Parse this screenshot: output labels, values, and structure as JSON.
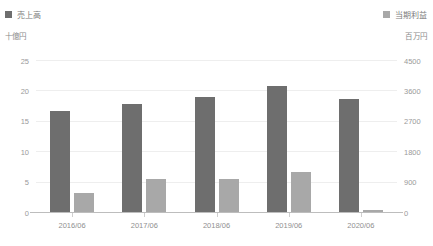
{
  "chart_data": {
    "type": "bar",
    "title": "",
    "categories": [
      "2016/06",
      "2017/06",
      "2018/06",
      "2019/06",
      "2020/06"
    ],
    "series": [
      {
        "name": "売上高",
        "axis": "left",
        "unit": "十億円",
        "color": "#6e6e6e",
        "values": [
          16.7,
          17.9,
          19.1,
          20.9,
          18.7
        ]
      },
      {
        "name": "当期利益",
        "axis": "right",
        "unit": "百万円",
        "color": "#a8a8a8",
        "values": [
          580,
          1000,
          1000,
          1200,
          100
        ]
      }
    ],
    "xlabel": "",
    "ylabel": "十億円",
    "y2label": "百万円",
    "ylim": [
      0,
      25
    ],
    "y2lim": [
      0,
      4500
    ],
    "yticks": [
      "0",
      "5",
      "10",
      "15",
      "20",
      "25"
    ],
    "ytick_values": [
      0,
      5,
      10,
      15,
      20,
      25
    ],
    "y2ticks": [
      "0",
      "900",
      "1800",
      "2700",
      "3600",
      "4500"
    ],
    "y2tick_values": [
      0,
      900,
      1800,
      2700,
      3600,
      4500
    ],
    "grid": true,
    "legend_position": "top"
  },
  "legend": {
    "left": {
      "label": "売上高",
      "color": "#6e6e6e"
    },
    "right": {
      "label": "当期利益",
      "color": "#a8a8a8"
    }
  },
  "units": {
    "left": "十億円",
    "right": "百万円"
  }
}
